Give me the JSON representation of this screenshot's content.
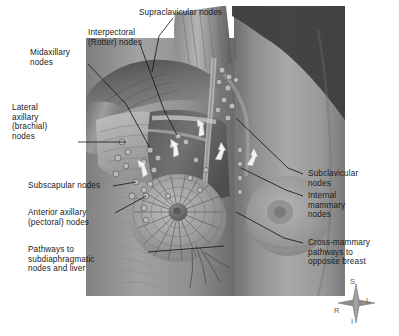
{
  "figure": {
    "background_color": "#ffffff",
    "ink_color": "#1a1a1a"
  },
  "labels": {
    "supraclavicular": "Supraclavicular nodes",
    "interpectoral": "Interpectoral\n(Rotter) nodes",
    "midaxillary": "Midaxillary\nnodes",
    "lateral_axillary": "Lateral\naxillary\n(brachial)\nnodes",
    "subscapular": "Subscapular nodes",
    "anterior_axillary": "Anterior axillary\n(pectoral) nodes",
    "subdiaphragmatic": "Pathways to\nsubdiaphragmatic\nnodes and liver",
    "subclavicular": "Subclavicular\nnodes",
    "internal_mammary": "Internal\nmammary\nnodes",
    "cross_mammary": "Cross-mammary\npathways to\nopposite breast"
  },
  "compass": {
    "superior": "S",
    "inferior": "I",
    "right": "R",
    "left": "L"
  }
}
